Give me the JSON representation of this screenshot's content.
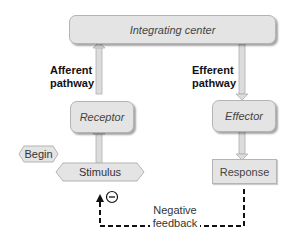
{
  "diagram": {
    "nodes": {
      "integrating_center": "Integrating center",
      "receptor": "Receptor",
      "effector": "Effector",
      "begin": "Begin",
      "stimulus": "Stimulus",
      "response": "Response"
    },
    "labels": {
      "afferent_line1": "Afferent",
      "afferent_line2": "pathway",
      "efferent_line1": "Efferent",
      "efferent_line2": "pathway",
      "feedback_line1": "Negative",
      "feedback_line2": "feedback",
      "minus_symbol": "−"
    },
    "colors": {
      "box_fill": "#e4e4e4",
      "box_border": "#b4b4b4",
      "arrow_fill": "#d8d8d8",
      "dashed_line": "#111111"
    }
  }
}
